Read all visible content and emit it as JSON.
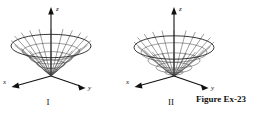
{
  "caption": {
    "text": "Figure Ex-23"
  },
  "figures": [
    {
      "id": "figure-one",
      "roman_label": "I",
      "surface": "cone",
      "axes": {
        "x_label": "x",
        "y_label": "y",
        "z_label": "z"
      }
    },
    {
      "id": "figure-two",
      "roman_label": "II",
      "surface": "paraboloid",
      "axes": {
        "x_label": "x",
        "y_label": "y",
        "z_label": "z"
      }
    }
  ],
  "colors": {
    "background": "#ffffff",
    "ink": "#111111",
    "wireframe": "#3a3a3a",
    "rim": "#222222"
  }
}
